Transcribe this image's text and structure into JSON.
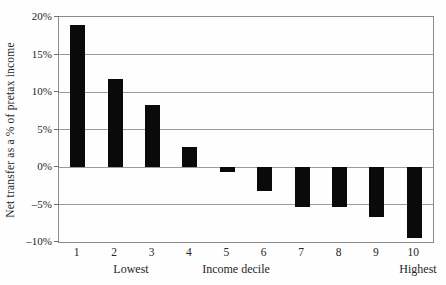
{
  "figure": {
    "background": "#fefefe",
    "bar_color": "#0a0a0a",
    "grid_color": "#9b9b9b",
    "border_color": "#8c8c8c",
    "text_color": "#262626"
  },
  "chart_data": {
    "type": "bar",
    "title": "",
    "xlabel": "Income decile",
    "ylabel": "Net transfer as a % of pretax income",
    "categories": [
      "1",
      "2",
      "3",
      "4",
      "5",
      "6",
      "7",
      "8",
      "9",
      "10"
    ],
    "values": [
      19.0,
      11.8,
      8.3,
      2.7,
      -0.7,
      -3.2,
      -5.3,
      -5.3,
      -6.7,
      -9.5
    ],
    "ylim": [
      -10,
      20
    ],
    "y_tick_interval": 5,
    "y_ticks": [
      {
        "value": 20,
        "label": "20%"
      },
      {
        "value": 15,
        "label": "15%"
      },
      {
        "value": 10,
        "label": "10%"
      },
      {
        "value": 5,
        "label": "5%"
      },
      {
        "value": 0,
        "label": "0%"
      },
      {
        "value": -5,
        "label": "–5%"
      },
      {
        "value": -10,
        "label": "–10%"
      }
    ],
    "x_sub_labels": {
      "left": "Lowest",
      "right": "Highest"
    },
    "grid": "horizontal",
    "legend": "none"
  }
}
